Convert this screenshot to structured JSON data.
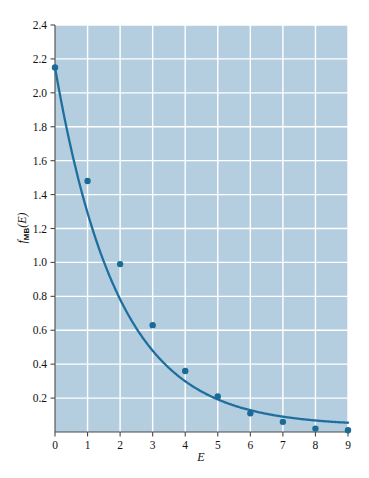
{
  "chart_data": {
    "type": "scatter",
    "title": "",
    "subtitle": "",
    "xlabel": "E",
    "ylabel": "f_MB(E)",
    "ylabel_parts": {
      "base": "f",
      "subscript": "MB",
      "arg": "(E)"
    },
    "xlim": [
      0,
      9
    ],
    "ylim": [
      0,
      2.4
    ],
    "grid": true,
    "legend": null,
    "legend_position": "none",
    "x_ticks": [
      0,
      1,
      2,
      3,
      4,
      5,
      6,
      7,
      8,
      9
    ],
    "x_tick_labels": [
      "0",
      "1",
      "2",
      "3",
      "4",
      "5",
      "6",
      "7",
      "8",
      "9"
    ],
    "y_ticks": [
      0.2,
      0.4,
      0.6,
      0.8,
      1.0,
      1.2,
      1.4,
      1.6,
      1.8,
      2.0,
      2.2,
      2.4
    ],
    "y_tick_labels": [
      "0.2",
      "0.4",
      "0.6",
      "0.8",
      "1.0",
      "1.2",
      "1.4",
      "1.6",
      "1.8",
      "2.0",
      "2.2",
      "2.4"
    ],
    "x": [
      0,
      1,
      2,
      3,
      4,
      5,
      6,
      7,
      8,
      9
    ],
    "series": [
      {
        "name": "data-points",
        "style": "markers",
        "values": [
          2.15,
          1.48,
          0.99,
          0.63,
          0.36,
          0.21,
          0.11,
          0.06,
          0.02,
          0.01
        ]
      },
      {
        "name": "fitted-curve",
        "style": "line",
        "curve_form": "exponential-decay",
        "amplitude": 2.15,
        "decay_constant": 0.52,
        "offset": 0.035,
        "values": [
          2.15,
          1.31,
          0.81,
          0.51,
          0.33,
          0.23,
          0.16,
          0.12,
          0.1,
          0.08
        ]
      }
    ],
    "colors": {
      "plot_background": "#b4cee0",
      "gridline": "#ffffff",
      "curve": "#1f6f9e",
      "marker": "#1a6b96",
      "axis": "#3a3a3a",
      "text": "#111111"
    }
  },
  "figure": {
    "plot_area": {
      "left": 55,
      "top": 25,
      "right": 348,
      "bottom": 432
    }
  }
}
